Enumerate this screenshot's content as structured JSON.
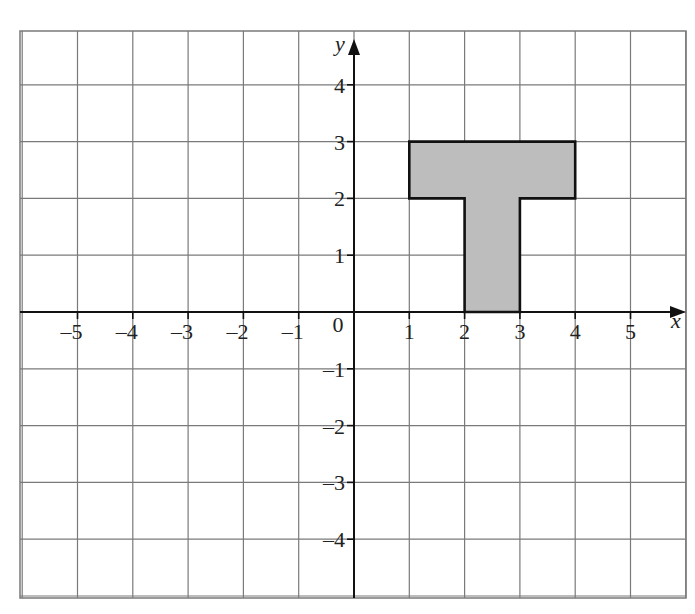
{
  "diagram": {
    "type": "coordinate-grid",
    "x_axis": {
      "name": "x",
      "min": -6,
      "max": 6,
      "tick_labels": [
        "–5",
        "–4",
        "–3",
        "–2",
        "–1",
        "1",
        "2",
        "3",
        "4",
        "5"
      ],
      "tick_values": [
        -5,
        -4,
        -3,
        -2,
        -1,
        1,
        2,
        3,
        4,
        5
      ]
    },
    "y_axis": {
      "name": "y",
      "min": -5,
      "max": 5,
      "tick_labels": [
        "4",
        "3",
        "2",
        "1",
        "–1",
        "–2",
        "–3",
        "–4"
      ],
      "tick_values": [
        4,
        3,
        2,
        1,
        -1,
        -2,
        -3,
        -4
      ]
    },
    "origin_label": "0",
    "shape": {
      "name": "T-shape",
      "fill": "#bdbdbd",
      "stroke": "#111111",
      "vertices": [
        [
          1,
          3
        ],
        [
          4,
          3
        ],
        [
          4,
          2
        ],
        [
          3,
          2
        ],
        [
          3,
          0
        ],
        [
          2,
          0
        ],
        [
          2,
          2
        ],
        [
          1,
          2
        ]
      ]
    },
    "colors": {
      "grid": "#7a7a7a",
      "axis": "#111111",
      "background": "#ffffff"
    }
  }
}
